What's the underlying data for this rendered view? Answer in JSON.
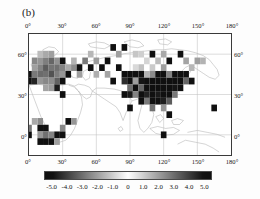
{
  "panel": {
    "label": "(b)"
  },
  "axes": {
    "x_ticks": [
      "0°",
      "30°",
      "60°",
      "90°",
      "120°",
      "150°",
      "180°"
    ],
    "x_values": [
      0,
      30,
      60,
      90,
      120,
      150,
      180
    ],
    "y_ticks": [
      "60°",
      "30°",
      "0°"
    ],
    "y_values": [
      60,
      30,
      0
    ],
    "xlim": [
      0,
      180
    ],
    "ylim": [
      -15,
      75
    ]
  },
  "colorbar": {
    "ticks": [
      "-5.0",
      "-4.0",
      "-3.0",
      "-2.0",
      "-1.0",
      "0",
      "1.0",
      "2.0",
      "3.0",
      "4.0",
      "5.0"
    ],
    "tick_values": [
      -5,
      -4,
      -3,
      -2,
      -1,
      0,
      1,
      2,
      3,
      4,
      5
    ],
    "vmin": -5.5,
    "vmax": 5.5,
    "orientation": "horizontal",
    "colormap": "grayscale-diverging",
    "color_low": "#101010",
    "color_mid": "#ffffff",
    "color_high": "#101010"
  },
  "chart_data": {
    "type": "heatmap",
    "title": "(b)",
    "xlabel": "",
    "ylabel": "",
    "projection": "cylindrical-equidistant",
    "grid": true,
    "grid_color": "#bdbdbd",
    "coastline_color": "#999999",
    "xlim": [
      0,
      180
    ],
    "ylim": [
      -15,
      75
    ],
    "cell_size_deg": 5,
    "legend": "colorbar-bottom",
    "value_range": [
      -5.5,
      5.5
    ],
    "cells": [
      {
        "lon": 0,
        "lat": 45,
        "v": -5.2
      },
      {
        "lon": 0,
        "lat": 40,
        "v": -5.0
      },
      {
        "lon": 5,
        "lat": 55,
        "v": -2.5
      },
      {
        "lon": 5,
        "lat": 50,
        "v": -2.0
      },
      {
        "lon": 5,
        "lat": 45,
        "v": -2.8
      },
      {
        "lon": 5,
        "lat": 40,
        "v": -4.6
      },
      {
        "lon": 10,
        "lat": 60,
        "v": -1.4
      },
      {
        "lon": 10,
        "lat": 55,
        "v": -2.2
      },
      {
        "lon": 10,
        "lat": 50,
        "v": -2.6
      },
      {
        "lon": 10,
        "lat": 45,
        "v": -3.1
      },
      {
        "lon": 10,
        "lat": 40,
        "v": -2.2
      },
      {
        "lon": 15,
        "lat": 60,
        "v": -1.8
      },
      {
        "lon": 15,
        "lat": 55,
        "v": -2.7
      },
      {
        "lon": 15,
        "lat": 50,
        "v": -3.4
      },
      {
        "lon": 15,
        "lat": 45,
        "v": -3.0
      },
      {
        "lon": 15,
        "lat": 40,
        "v": -2.5
      },
      {
        "lon": 15,
        "lat": 35,
        "v": -1.9
      },
      {
        "lon": 20,
        "lat": 60,
        "v": -2.0
      },
      {
        "lon": 20,
        "lat": 55,
        "v": -3.2
      },
      {
        "lon": 20,
        "lat": 50,
        "v": -2.9
      },
      {
        "lon": 20,
        "lat": 45,
        "v": -3.6
      },
      {
        "lon": 20,
        "lat": 40,
        "v": -2.4
      },
      {
        "lon": 20,
        "lat": 35,
        "v": -2.1
      },
      {
        "lon": 25,
        "lat": 55,
        "v": -2.3
      },
      {
        "lon": 25,
        "lat": 50,
        "v": -3.0
      },
      {
        "lon": 25,
        "lat": 45,
        "v": -2.7
      },
      {
        "lon": 25,
        "lat": 40,
        "v": -3.3
      },
      {
        "lon": 25,
        "lat": 35,
        "v": -4.8
      },
      {
        "lon": 30,
        "lat": 55,
        "v": -5.1
      },
      {
        "lon": 30,
        "lat": 50,
        "v": -2.6
      },
      {
        "lon": 30,
        "lat": 45,
        "v": -2.2
      },
      {
        "lon": 30,
        "lat": 40,
        "v": -5.0
      },
      {
        "lon": 30,
        "lat": 30,
        "v": -5.2
      },
      {
        "lon": 35,
        "lat": 50,
        "v": -1.8
      },
      {
        "lon": 35,
        "lat": 45,
        "v": -5.3
      },
      {
        "lon": 40,
        "lat": 55,
        "v": -1.6
      },
      {
        "lon": 40,
        "lat": 50,
        "v": -2.4
      },
      {
        "lon": 45,
        "lat": 50,
        "v": -5.1
      },
      {
        "lon": 45,
        "lat": 45,
        "v": -2.0
      },
      {
        "lon": 50,
        "lat": 55,
        "v": -2.8
      },
      {
        "lon": 55,
        "lat": 60,
        "v": -1.5
      },
      {
        "lon": 55,
        "lat": 50,
        "v": -5.0
      },
      {
        "lon": 60,
        "lat": 55,
        "v": -2.1
      },
      {
        "lon": 60,
        "lat": 45,
        "v": -1.7
      },
      {
        "lon": 65,
        "lat": 50,
        "v": -5.2
      },
      {
        "lon": 70,
        "lat": 55,
        "v": -5.0
      },
      {
        "lon": 70,
        "lat": 45,
        "v": -1.9
      },
      {
        "lon": 75,
        "lat": 65,
        "v": -5.1
      },
      {
        "lon": 75,
        "lat": 40,
        "v": -5.0
      },
      {
        "lon": 80,
        "lat": 60,
        "v": -2.0
      },
      {
        "lon": 80,
        "lat": 50,
        "v": -5.2
      },
      {
        "lon": 85,
        "lat": 65,
        "v": -5.3
      },
      {
        "lon": 85,
        "lat": 45,
        "v": -5.1
      },
      {
        "lon": 85,
        "lat": 40,
        "v": -4.4
      },
      {
        "lon": 85,
        "lat": 30,
        "v": -5.0
      },
      {
        "lon": 90,
        "lat": 45,
        "v": -5.2
      },
      {
        "lon": 90,
        "lat": 40,
        "v": -5.0
      },
      {
        "lon": 90,
        "lat": 35,
        "v": -3.0
      },
      {
        "lon": 90,
        "lat": 30,
        "v": -4.8
      },
      {
        "lon": 90,
        "lat": 20,
        "v": -5.0
      },
      {
        "lon": 95,
        "lat": 60,
        "v": -1.2
      },
      {
        "lon": 95,
        "lat": 50,
        "v": -0.8
      },
      {
        "lon": 95,
        "lat": 45,
        "v": -5.1
      },
      {
        "lon": 95,
        "lat": 40,
        "v": -2.0
      },
      {
        "lon": 95,
        "lat": 35,
        "v": -5.0
      },
      {
        "lon": 95,
        "lat": 30,
        "v": -2.6
      },
      {
        "lon": 100,
        "lat": 60,
        "v": -1.0
      },
      {
        "lon": 100,
        "lat": 50,
        "v": -1.3
      },
      {
        "lon": 100,
        "lat": 45,
        "v": -5.0
      },
      {
        "lon": 100,
        "lat": 40,
        "v": -4.9
      },
      {
        "lon": 100,
        "lat": 35,
        "v": -3.2
      },
      {
        "lon": 100,
        "lat": 30,
        "v": -5.1
      },
      {
        "lon": 100,
        "lat": 25,
        "v": -5.0
      },
      {
        "lon": 105,
        "lat": 55,
        "v": -0.9
      },
      {
        "lon": 105,
        "lat": 45,
        "v": -1.6
      },
      {
        "lon": 105,
        "lat": 40,
        "v": -5.2
      },
      {
        "lon": 105,
        "lat": 35,
        "v": -5.0
      },
      {
        "lon": 105,
        "lat": 30,
        "v": -4.6
      },
      {
        "lon": 105,
        "lat": 25,
        "v": -2.8
      },
      {
        "lon": 110,
        "lat": 60,
        "v": -5.0
      },
      {
        "lon": 110,
        "lat": 50,
        "v": -1.1
      },
      {
        "lon": 110,
        "lat": 45,
        "v": -2.4
      },
      {
        "lon": 110,
        "lat": 40,
        "v": -5.1
      },
      {
        "lon": 110,
        "lat": 35,
        "v": -5.0
      },
      {
        "lon": 110,
        "lat": 30,
        "v": -5.2
      },
      {
        "lon": 110,
        "lat": 25,
        "v": -5.0
      },
      {
        "lon": 110,
        "lat": 20,
        "v": -3.0
      },
      {
        "lon": 115,
        "lat": 55,
        "v": -1.4
      },
      {
        "lon": 115,
        "lat": 45,
        "v": -5.0
      },
      {
        "lon": 115,
        "lat": 40,
        "v": -5.1
      },
      {
        "lon": 115,
        "lat": 35,
        "v": -5.0
      },
      {
        "lon": 115,
        "lat": 30,
        "v": -4.8
      },
      {
        "lon": 115,
        "lat": 25,
        "v": -5.0
      },
      {
        "lon": 120,
        "lat": 60,
        "v": -1.8
      },
      {
        "lon": 120,
        "lat": 50,
        "v": -2.0
      },
      {
        "lon": 120,
        "lat": 45,
        "v": -5.0
      },
      {
        "lon": 120,
        "lat": 40,
        "v": -5.2
      },
      {
        "lon": 120,
        "lat": 35,
        "v": -5.0
      },
      {
        "lon": 120,
        "lat": 30,
        "v": -5.1
      },
      {
        "lon": 120,
        "lat": 25,
        "v": -4.7
      },
      {
        "lon": 120,
        "lat": 20,
        "v": -2.2
      },
      {
        "lon": 120,
        "lat": 0,
        "v": -5.0
      },
      {
        "lon": 125,
        "lat": 55,
        "v": -5.0
      },
      {
        "lon": 125,
        "lat": 45,
        "v": -2.6
      },
      {
        "lon": 125,
        "lat": 40,
        "v": -5.0
      },
      {
        "lon": 125,
        "lat": 35,
        "v": -5.1
      },
      {
        "lon": 125,
        "lat": 30,
        "v": -5.0
      },
      {
        "lon": 125,
        "lat": 25,
        "v": -3.4
      },
      {
        "lon": 125,
        "lat": 15,
        "v": -5.0
      },
      {
        "lon": 130,
        "lat": 45,
        "v": -5.1
      },
      {
        "lon": 130,
        "lat": 40,
        "v": -5.0
      },
      {
        "lon": 130,
        "lat": 35,
        "v": -4.9
      },
      {
        "lon": 130,
        "lat": 30,
        "v": -2.8
      },
      {
        "lon": 135,
        "lat": 60,
        "v": -5.0
      },
      {
        "lon": 135,
        "lat": 45,
        "v": -5.2
      },
      {
        "lon": 135,
        "lat": 40,
        "v": -5.0
      },
      {
        "lon": 135,
        "lat": 35,
        "v": -5.1
      },
      {
        "lon": 140,
        "lat": 55,
        "v": -1.9
      },
      {
        "lon": 140,
        "lat": 45,
        "v": -5.0
      },
      {
        "lon": 140,
        "lat": 40,
        "v": -3.2
      },
      {
        "lon": 145,
        "lat": 50,
        "v": -1.5
      },
      {
        "lon": 145,
        "lat": 40,
        "v": -5.0
      },
      {
        "lon": 150,
        "lat": 55,
        "v": -2.0
      },
      {
        "lon": 155,
        "lat": 55,
        "v": -1.6
      },
      {
        "lon": 165,
        "lat": 20,
        "v": -5.0
      },
      {
        "lon": 10,
        "lat": 10,
        "v": -2.4
      },
      {
        "lon": 10,
        "lat": 5,
        "v": -5.0
      },
      {
        "lon": 10,
        "lat": 0,
        "v": -2.2
      },
      {
        "lon": 10,
        "lat": -5,
        "v": -5.1
      },
      {
        "lon": 15,
        "lat": 5,
        "v": -5.0
      },
      {
        "lon": 15,
        "lat": 0,
        "v": -3.0
      },
      {
        "lon": 15,
        "lat": -5,
        "v": -5.0
      },
      {
        "lon": 20,
        "lat": 0,
        "v": -2.6
      },
      {
        "lon": 20,
        "lat": -5,
        "v": -5.2
      },
      {
        "lon": 25,
        "lat": 0,
        "v": -5.0
      },
      {
        "lon": 25,
        "lat": -5,
        "v": -2.0
      },
      {
        "lon": 30,
        "lat": 5,
        "v": -2.5
      },
      {
        "lon": 30,
        "lat": 0,
        "v": -5.0
      },
      {
        "lon": 35,
        "lat": 10,
        "v": -5.1
      },
      {
        "lon": 0,
        "lat": 5,
        "v": -2.8
      },
      {
        "lon": 0,
        "lat": 0,
        "v": -5.0
      },
      {
        "lon": 5,
        "lat": 10,
        "v": -1.8
      },
      {
        "lon": 40,
        "lat": 10,
        "v": -2.2
      }
    ]
  }
}
